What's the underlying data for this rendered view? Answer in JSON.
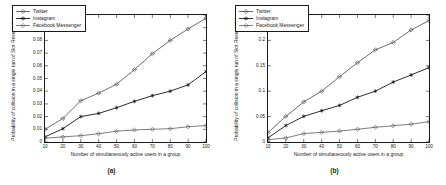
{
  "figure": {
    "panels": [
      {
        "caption": "(a)",
        "xlabel": "Number of simultaneously active users in a group",
        "ylabel": "Probability of collision in a single run of Slot Reservation"
      },
      {
        "caption": "(b)",
        "xlabel": "Number of simultaneously active users in a group",
        "ylabel": "Probability of collision in a single run of Slot Reservation"
      }
    ]
  },
  "chart_data": [
    {
      "type": "line",
      "title": "(a)",
      "xlabel": "Number of simultaneously active users in a group",
      "ylabel": "Probability of collision in a single run of Slot Reservation",
      "x": [
        10,
        20,
        30,
        40,
        50,
        60,
        70,
        80,
        90,
        100
      ],
      "xlim": [
        10,
        100
      ],
      "ylim": [
        0,
        0.1
      ],
      "xticks": [
        10,
        20,
        30,
        40,
        50,
        60,
        70,
        80,
        90,
        100
      ],
      "yticks": [
        0,
        0.01,
        0.02,
        0.03,
        0.04,
        0.05,
        0.06,
        0.07,
        0.08,
        0.09,
        0.1
      ],
      "ytick_labels": [
        "0",
        "0.01",
        "0.02",
        "0.03",
        "0.04",
        "0.05",
        "0.06",
        "0.07",
        "0.08",
        "0.09",
        "0.1"
      ],
      "xtick_labels": [
        "10",
        "20",
        "30",
        "40",
        "50",
        "60",
        "70",
        "80",
        "90",
        "100"
      ],
      "grid": false,
      "legend_position": "top-left",
      "series": [
        {
          "name": "Twitter",
          "marker": "diamond",
          "color": "#5a5a5a",
          "values": [
            0.01,
            0.0185,
            0.0325,
            0.0385,
            0.0455,
            0.057,
            0.0695,
            0.08,
            0.089,
            0.0975
          ]
        },
        {
          "name": "Instagram",
          "marker": "asterisk",
          "color": "#141414",
          "values": [
            0.004,
            0.0105,
            0.02,
            0.0225,
            0.027,
            0.032,
            0.0365,
            0.04,
            0.045,
            0.0555
          ]
        },
        {
          "name": "Facebook Messenger",
          "marker": "diamond",
          "color": "#6e6e6e",
          "values": [
            0.003,
            0.004,
            0.005,
            0.0065,
            0.0085,
            0.0095,
            0.01,
            0.0105,
            0.012,
            0.013
          ]
        }
      ]
    },
    {
      "type": "line",
      "title": "(b)",
      "xlabel": "Number of simultaneously active users in a group",
      "ylabel": "Probability of collision in a single run of Slot Reservation",
      "x": [
        10,
        20,
        30,
        40,
        50,
        60,
        70,
        80,
        90,
        100
      ],
      "xlim": [
        10,
        100
      ],
      "ylim": [
        0,
        0.25
      ],
      "xticks": [
        10,
        20,
        30,
        40,
        50,
        60,
        70,
        80,
        90,
        100
      ],
      "yticks": [
        0,
        0.05,
        0.1,
        0.15,
        0.2,
        0.25
      ],
      "ytick_labels": [
        "0",
        "0.05",
        "0.1",
        "0.15",
        "0.2",
        "0.25"
      ],
      "xtick_labels": [
        "10",
        "20",
        "30",
        "40",
        "50",
        "60",
        "70",
        "80",
        "90",
        "100"
      ],
      "grid": false,
      "legend_position": "top-left",
      "series": [
        {
          "name": "Twitter",
          "marker": "diamond",
          "color": "#5a5a5a",
          "values": [
            0.0185,
            0.0505,
            0.079,
            0.1,
            0.1285,
            0.156,
            0.1815,
            0.196,
            0.2205,
            0.239
          ]
        },
        {
          "name": "Instagram",
          "marker": "asterisk",
          "color": "#141414",
          "values": [
            0.008,
            0.0325,
            0.0505,
            0.0615,
            0.072,
            0.088,
            0.1,
            0.118,
            0.132,
            0.1465
          ]
        },
        {
          "name": "Facebook Messenger",
          "marker": "diamond",
          "color": "#6e6e6e",
          "values": [
            0.0045,
            0.008,
            0.0165,
            0.019,
            0.0215,
            0.025,
            0.029,
            0.032,
            0.035,
            0.04
          ]
        }
      ]
    }
  ]
}
